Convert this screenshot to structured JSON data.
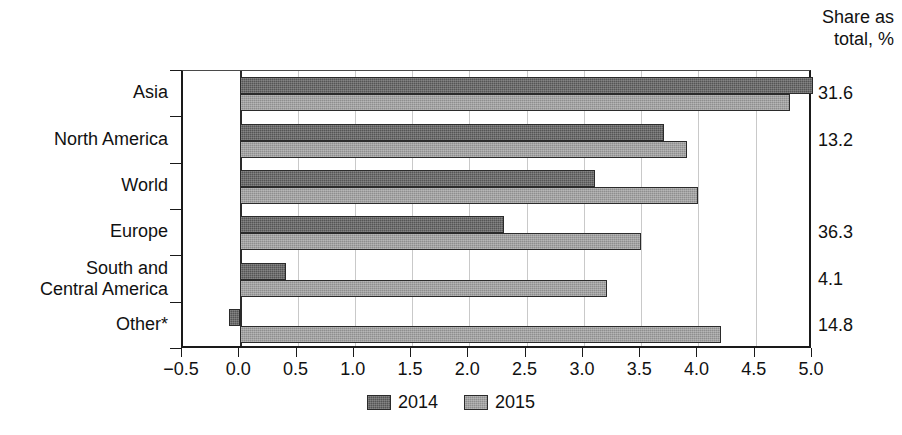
{
  "chart_data": {
    "type": "bar",
    "orientation": "horizontal",
    "title": "",
    "subtitle": "",
    "xlabel": "",
    "ylabel": "",
    "xlim": [
      -0.5,
      5.0
    ],
    "xticks": [
      "−0.5",
      "0.0",
      "0.5",
      "1.0",
      "1.5",
      "2.0",
      "2.5",
      "3.0",
      "3.5",
      "4.0",
      "4.5",
      "5.0"
    ],
    "xtick_values": [
      -0.5,
      0.0,
      0.5,
      1.0,
      1.5,
      2.0,
      2.5,
      3.0,
      3.5,
      4.0,
      4.5,
      5.0
    ],
    "grid": true,
    "grid_axis": "x",
    "legend_position": "bottom",
    "categories": [
      "Asia",
      "North America",
      "World",
      "Europe",
      "South and\nCentral America",
      "Other*"
    ],
    "series": [
      {
        "name": "2014",
        "color": "#555555",
        "values": [
          5.0,
          3.7,
          3.1,
          2.3,
          0.4,
          -0.1
        ]
      },
      {
        "name": "2015",
        "color": "#8e8e8e",
        "values": [
          4.8,
          3.9,
          4.0,
          3.5,
          3.2,
          4.2
        ]
      }
    ],
    "annotations": {
      "right_column_header": "Share as\ntotal, %",
      "right_column_values": [
        "31.6",
        "13.2",
        "",
        "36.3",
        "4.1",
        "14.8"
      ]
    }
  },
  "right_column": {
    "header": "Share as\ntotal, %",
    "values": [
      "31.6",
      "13.2",
      "",
      "36.3",
      "4.1",
      "14.8"
    ]
  },
  "legend": {
    "items": [
      {
        "label": "2014",
        "swatch": "legend-swatch-2014"
      },
      {
        "label": "2015",
        "swatch": "legend-swatch-2015"
      }
    ]
  }
}
